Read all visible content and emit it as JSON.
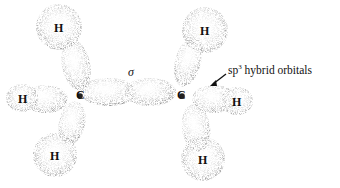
{
  "figure": {
    "labels": {
      "sigma": "σ",
      "carbon_left": "C",
      "carbon_right": "C",
      "hydrogens": [
        "H",
        "H",
        "H",
        "H",
        "H",
        "H"
      ],
      "annotation_prefix": "sp",
      "annotation_sup": "3",
      "annotation_suffix": " hybrid orbitals"
    },
    "colors": {
      "stipple": "#555555",
      "background": "#ffffff",
      "text": "#111111"
    }
  }
}
